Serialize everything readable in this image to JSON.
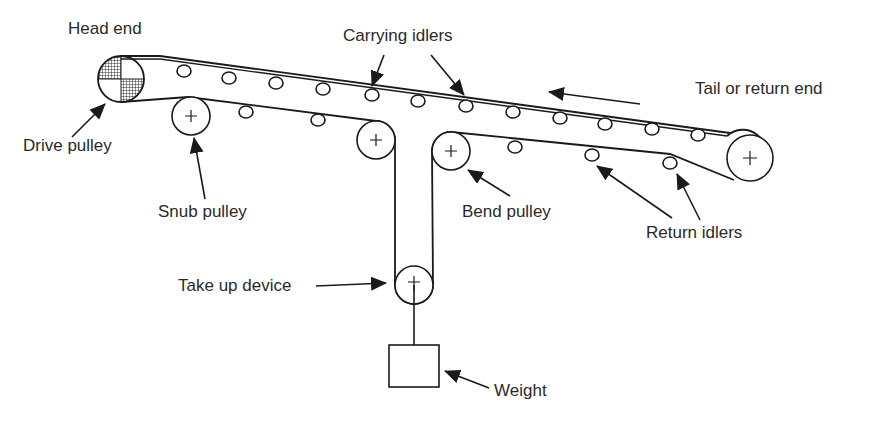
{
  "labels": {
    "head_end": "Head end",
    "carrying_idlers": "Carrying idlers",
    "tail_end": "Tail or return end",
    "drive_pulley": "Drive pulley",
    "snub_pulley": "Snub pulley",
    "bend_pulley": "Bend pulley",
    "return_idlers": "Return idlers",
    "take_up_device": "Take up device",
    "weight": "Weight"
  },
  "colors": {
    "stroke": "#1a1a1a",
    "text": "#2a2a2a",
    "background": "#ffffff"
  },
  "components": {
    "drive_pulley": {
      "cx": 121,
      "cy": 79,
      "r": 23,
      "style": "hatched-quadrants"
    },
    "tail_pulley": {
      "cx": 750,
      "cy": 158,
      "r": 23
    },
    "snub_pulley": {
      "cx": 191,
      "cy": 116,
      "r": 19
    },
    "bend_pulley_left": {
      "cx": 376,
      "cy": 140,
      "r": 19
    },
    "bend_pulley_right": {
      "cx": 451,
      "cy": 151,
      "r": 19
    },
    "take_up_pulley": {
      "cx": 414,
      "cy": 285,
      "r": 19
    },
    "weight_box": {
      "x": 389,
      "y": 345,
      "w": 50,
      "h": 42
    },
    "carrying_idlers": [
      [
        184,
        71
      ],
      [
        229,
        78
      ],
      [
        276,
        83
      ],
      [
        323,
        89
      ],
      [
        372,
        95
      ],
      [
        418,
        101
      ],
      [
        466,
        106
      ],
      [
        513,
        112
      ],
      [
        560,
        118
      ],
      [
        605,
        124
      ],
      [
        652,
        129
      ],
      [
        698,
        135
      ]
    ],
    "return_idlers": [
      [
        246,
        112
      ],
      [
        318,
        120
      ],
      [
        515,
        147
      ],
      [
        592,
        155
      ],
      [
        670,
        163
      ]
    ],
    "direction_arrow": {
      "from": [
        640,
        104
      ],
      "to": [
        548,
        92
      ]
    }
  }
}
